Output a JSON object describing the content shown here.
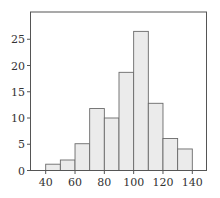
{
  "chart_data": {
    "type": "bar",
    "subtype": "histogram",
    "title": "",
    "xlabel": "",
    "ylabel": "",
    "bin_edges": [
      40,
      50,
      60,
      70,
      80,
      90,
      100,
      110,
      120,
      130,
      140
    ],
    "categories": [
      "40-50",
      "50-60",
      "60-70",
      "70-80",
      "80-90",
      "90-100",
      "100-110",
      "110-120",
      "120-130",
      "130-140"
    ],
    "values": [
      1.2,
      2,
      5.1,
      11.8,
      10,
      18.7,
      26.5,
      12.8,
      6.1,
      4.1
    ],
    "xlim": [
      30,
      150
    ],
    "ylim": [
      0,
      30
    ],
    "xticks": [
      40,
      60,
      80,
      100,
      120,
      140
    ],
    "yticks": [
      0,
      5,
      10,
      15,
      20,
      25
    ],
    "grid": false,
    "legend": null,
    "colors": {
      "bar_fill": "#ebebeb",
      "bar_edge": "#6a6a6a",
      "frame": "#555555",
      "text": "#333333"
    }
  }
}
